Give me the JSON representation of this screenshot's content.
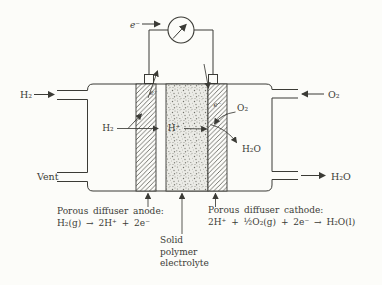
{
  "colors": {
    "ink": "#3b3b36",
    "paper": "#fcfcf9",
    "electrolyte_fill": "#ebebe6",
    "stipple_dot": "#82827b"
  },
  "top_circuit": {
    "electron_label": "e⁻"
  },
  "streams": {
    "h2_in": "H₂",
    "o2_in": "O₂",
    "vent": "Vent",
    "h2o_out": "H₂O"
  },
  "cell_interior": {
    "h2": "H₂",
    "h_plus": "H⁺",
    "o2": "O₂",
    "h2o": "H₂O",
    "electron_anode": "e⁻",
    "electron_cathode": "e⁻"
  },
  "captions": {
    "anode_title": "Porous diffuser anode:",
    "anode_reaction": "H₂(g) → 2H⁺ + 2e⁻",
    "cathode_title": "Porous diffuser cathode:",
    "cathode_reaction": "2H⁺ + ½O₂(g) + 2e⁻ → H₂O(l)",
    "electrolyte_line1": "Solid",
    "electrolyte_line2": "polymer",
    "electrolyte_line3": "electrolyte"
  }
}
